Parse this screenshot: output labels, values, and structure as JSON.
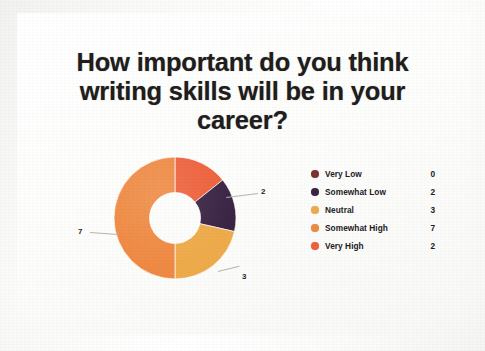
{
  "slide": {
    "title_lines": [
      "How important do you think",
      "writing skills will be in your",
      "career?"
    ],
    "title_full": "How important do you think writing skills will be in your career?"
  },
  "chart_data": {
    "type": "pie",
    "variant": "donut",
    "title": "How important do you think writing skills will be in your career?",
    "categories": [
      "Very Low",
      "Somewhat Low",
      "Neutral",
      "Somewhat High",
      "Very High"
    ],
    "values": [
      0,
      2,
      3,
      7,
      2
    ],
    "total": 14,
    "colors": [
      "#7b3430",
      "#3b2545",
      "#eeab4b",
      "#ef8a43",
      "#ee613c"
    ],
    "legend_position": "right",
    "grid": false,
    "xlabel": "",
    "ylabel": "",
    "slice_order_clockwise_from_top": [
      "Very High",
      "Somewhat Low",
      "Neutral",
      "Somewhat High"
    ],
    "data_labels": [
      {
        "text": "2",
        "category": "Somewhat Low"
      },
      {
        "text": "3",
        "category": "Neutral"
      },
      {
        "text": "7",
        "category": "Somewhat High"
      }
    ]
  },
  "legend": {
    "rows": [
      {
        "label": "Very Low",
        "value": "0",
        "color": "#7b3430"
      },
      {
        "label": "Somewhat Low",
        "value": "2",
        "color": "#3b2545"
      },
      {
        "label": "Neutral",
        "value": "3",
        "color": "#eeab4b"
      },
      {
        "label": "Somewhat High",
        "value": "7",
        "color": "#ef8a43"
      },
      {
        "label": "Very High",
        "value": "2",
        "color": "#ee613c"
      }
    ]
  },
  "leaders": {
    "somewhat_low": "2",
    "neutral": "3",
    "somewhat_high": "7"
  }
}
